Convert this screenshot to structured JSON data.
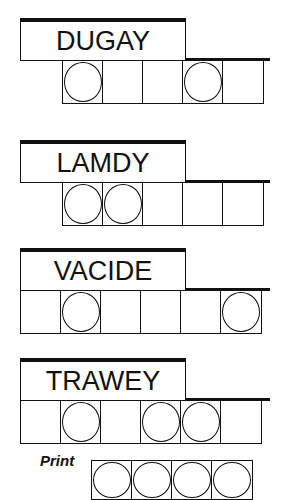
{
  "puzzles": [
    {
      "scrambled": "DUGAY",
      "top": 18,
      "cells_left": 62,
      "cell_count": 5,
      "circled": [
        0,
        3
      ]
    },
    {
      "scrambled": "LAMDY",
      "top": 140,
      "cells_left": 62,
      "cell_count": 5,
      "circled": [
        0,
        1
      ]
    },
    {
      "scrambled": "VACIDE",
      "top": 248,
      "cells_left": 20,
      "cell_count": 6,
      "circled": [
        1,
        5
      ]
    },
    {
      "scrambled": "TRAWEY",
      "top": 358,
      "cells_left": 20,
      "cell_count": 6,
      "circled": [
        1,
        3,
        4
      ]
    }
  ],
  "answer": {
    "label": "Print",
    "cell_count": 4,
    "circled": [
      0,
      1,
      2,
      3
    ]
  },
  "colors": {
    "ink": "#111111",
    "background": "#ffffff"
  }
}
